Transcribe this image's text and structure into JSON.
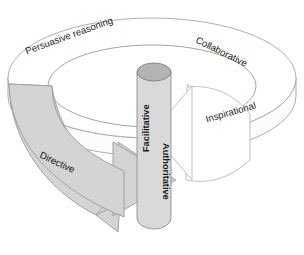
{
  "diagram": {
    "background_color": "#ffffff",
    "ring": {
      "fill_color": "#ffffff",
      "stroke_color": "#a6a6a6",
      "labels": [
        {
          "id": "persuasive-reasoning",
          "text": "Persuasive reasoning",
          "rotation_deg": -20,
          "x": 26,
          "y": 52
        },
        {
          "id": "collaborative",
          "text": "Collaborative",
          "rotation_deg": 26,
          "x": 196,
          "y": 40
        },
        {
          "id": "inspirational",
          "text": "Inspirational",
          "rotation_deg": -16,
          "x": 206,
          "y": 120
        },
        {
          "id": "directive",
          "text": "Directive",
          "rotation_deg": 25,
          "x": 40,
          "y": 155
        }
      ]
    },
    "cylinder": {
      "fill_color": "#d9d9d9",
      "top_color": "#b3b3b3",
      "stroke_color": "#8f8f8f",
      "labels": [
        {
          "id": "facilitative",
          "text": "Facilitative",
          "rotation_deg": -90,
          "x": 147,
          "y": 115
        },
        {
          "id": "authoritative",
          "text": "Authoritative",
          "rotation_deg": 90,
          "x": 163,
          "y": 182
        }
      ]
    },
    "arrows": [
      {
        "id": "directive-arrow",
        "direction": "right",
        "fill_color": "#d4d4d4",
        "stroke_color": "#9b9b9b"
      },
      {
        "id": "inspirational-arrow",
        "direction": "left",
        "fill_color": "#ffffff",
        "stroke_color": "#b8b8b8"
      }
    ]
  }
}
